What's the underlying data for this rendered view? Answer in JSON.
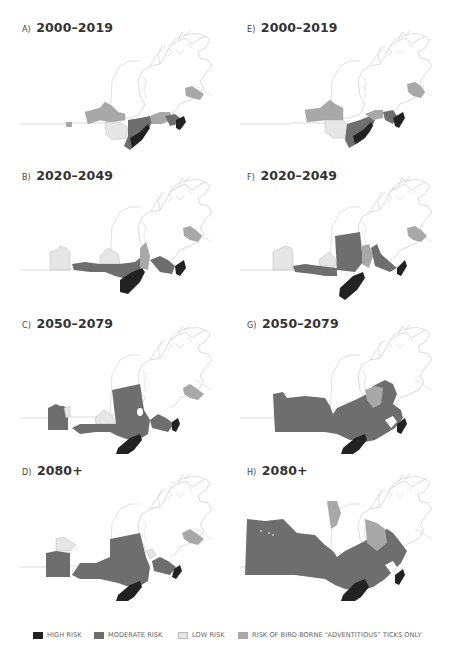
{
  "figure": {
    "colors": {
      "high": "#222222",
      "moderate": "#6e6e6e",
      "low": "#e6e6e6",
      "adventitious": "#a8a8a8",
      "outline": "#c8c8c8"
    },
    "panels": [
      {
        "letter": "A)",
        "period": "2000–2019",
        "column": "left"
      },
      {
        "letter": "B)",
        "period": "2020–2049",
        "column": "left"
      },
      {
        "letter": "C)",
        "period": "2050–2079",
        "column": "left"
      },
      {
        "letter": "D)",
        "period": "2080+",
        "column": "left"
      },
      {
        "letter": "E)",
        "period": "2000–2019",
        "column": "right"
      },
      {
        "letter": "F)",
        "period": "2020–2049",
        "column": "right"
      },
      {
        "letter": "G)",
        "period": "2050–2079",
        "column": "right"
      },
      {
        "letter": "H)",
        "period": "2080+",
        "column": "right"
      }
    ]
  },
  "legend": {
    "items": [
      {
        "label": "HIGH RISK",
        "color": "#222222"
      },
      {
        "label": "MODERATE RISK",
        "color": "#6e6e6e"
      },
      {
        "label": "LOW RISK",
        "color": "#e6e6e6"
      },
      {
        "label": "RISK OF BIRD-BORNE “ADVENTITIOUS” TICKS ONLY",
        "color": "#a8a8a8"
      }
    ]
  }
}
